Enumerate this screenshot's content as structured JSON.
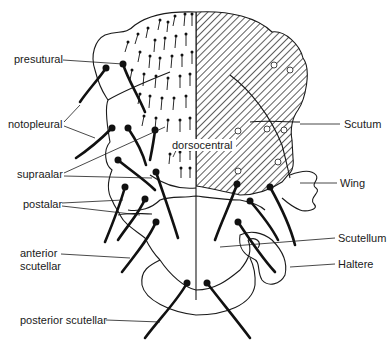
{
  "figure": {
    "colors": {
      "ink": "#1a1a1a",
      "background": "#ffffff"
    },
    "labels_left": [
      {
        "id": "presutural",
        "text": "presutural"
      },
      {
        "id": "notopleural",
        "text": "notopleural"
      },
      {
        "id": "supraalar",
        "text": "supraalar"
      },
      {
        "id": "postalar",
        "text": "postalar"
      },
      {
        "id": "anterior-scutellar-1",
        "text": "anterior"
      },
      {
        "id": "anterior-scutellar-2",
        "text": "scutellar"
      },
      {
        "id": "posterior-scutellar",
        "text": "posterior  scutellar"
      }
    ],
    "labels_center": [
      {
        "id": "dorsocentral",
        "text": "dorsocentral"
      }
    ],
    "labels_right": [
      {
        "id": "scutum",
        "text": "Scutum"
      },
      {
        "id": "wing",
        "text": "Wing"
      },
      {
        "id": "scutellum",
        "text": "Scutellum"
      },
      {
        "id": "haltere",
        "text": "Haltere"
      }
    ]
  }
}
